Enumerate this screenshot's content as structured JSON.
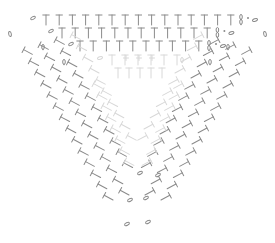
{
  "diagram": {
    "type": "crochet-symbol-chart",
    "shape": "inverted-triangle",
    "stroke_color": "#8a8a8a",
    "faded_color": "#d8d8d8",
    "background": "#ffffff",
    "symbols": {
      "hdc": "T-stitch",
      "chain": "oval",
      "slip": "dot",
      "plus": "single-crochet"
    },
    "top_rows": [
      {
        "y": 20,
        "x_start": 46,
        "count": 15,
        "step": 13.2,
        "lead_chain_x": 33,
        "tail": true
      },
      {
        "y": 33,
        "x_start": 62,
        "count": 12,
        "step": 13.2,
        "lead_chain_x": 51,
        "tail": true
      },
      {
        "y": 46,
        "x_start": 80,
        "count": 10,
        "step": 13.2,
        "lead_chain_x": 71,
        "tail": true
      }
    ],
    "left_side": {
      "rows": 14,
      "cols": 4,
      "origin_x": 28,
      "origin_y": 52,
      "row_dx": 6.2,
      "row_dy": 11.2,
      "col_dx": 16,
      "col_dy": -5,
      "angle": -28
    },
    "right_side": {
      "rows": 14,
      "cols": 4,
      "origin_x": 246,
      "origin_y": 52,
      "row_dx": -6.2,
      "row_dy": 11.2,
      "col_dx": -16,
      "col_dy": -5,
      "angle": 28
    },
    "bottom_chains": [
      {
        "x": 127,
        "y": 224
      },
      {
        "x": 148,
        "y": 222
      },
      {
        "x": 130,
        "y": 200
      },
      {
        "x": 146,
        "y": 198
      },
      {
        "x": 140,
        "y": 173
      },
      {
        "x": 158,
        "y": 175
      }
    ]
  }
}
